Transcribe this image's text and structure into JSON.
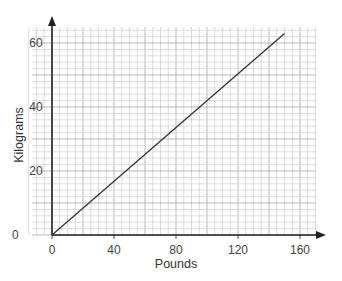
{
  "chart_data": {
    "type": "line",
    "title": "",
    "xlabel": "Pounds",
    "ylabel": "Kilograms",
    "xlim": [
      0,
      170
    ],
    "ylim": [
      0,
      65
    ],
    "x_ticks": [
      0,
      40,
      80,
      120,
      160
    ],
    "y_ticks": [
      0,
      20,
      40,
      60
    ],
    "x_tick_labels": [
      "0",
      "40",
      "80",
      "120",
      "160"
    ],
    "y_tick_labels": [
      "0",
      "20",
      "40",
      "60"
    ],
    "grid": true,
    "grid_minor_x_step": 5,
    "grid_minor_y_step": 2,
    "grid_major_x_step": 20,
    "grid_major_y_step": 10,
    "legend": null,
    "series": [
      {
        "name": "Pounds to Kilograms",
        "x": [
          0,
          150
        ],
        "y": [
          0,
          63
        ],
        "color": "#333333"
      }
    ]
  },
  "colors": {
    "axis": "#222222",
    "grid_minor": "#d4d4d4",
    "grid_major": "#a8a8a8",
    "line": "#333333",
    "text": "#444444"
  }
}
